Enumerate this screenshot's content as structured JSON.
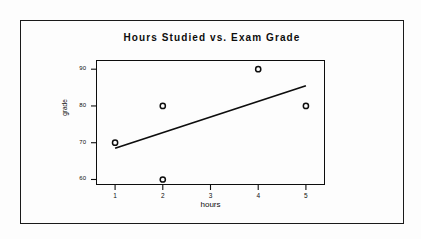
{
  "chart_data": {
    "type": "scatter",
    "title": "Hours Studied vs. Exam Grade",
    "xlabel": "hours",
    "ylabel": "grade",
    "x": [
      1,
      2,
      2,
      4,
      5
    ],
    "values": [
      70,
      80,
      60,
      90,
      80
    ],
    "points": [
      {
        "x": 1,
        "y": 70
      },
      {
        "x": 2,
        "y": 80
      },
      {
        "x": 2,
        "y": 60
      },
      {
        "x": 4,
        "y": 90
      },
      {
        "x": 5,
        "y": 80
      }
    ],
    "series": [
      {
        "name": "observations",
        "x": [
          1,
          2,
          2,
          4,
          5
        ],
        "values": [
          70,
          80,
          60,
          90,
          80
        ]
      },
      {
        "name": "trend line",
        "type": "line",
        "x": [
          1,
          5
        ],
        "values": [
          68.5,
          85.5
        ]
      }
    ],
    "xticks": [
      "1",
      "2",
      "3",
      "4",
      "5"
    ],
    "xtick_values": [
      1,
      2,
      3,
      4,
      5
    ],
    "yticks": [
      "60",
      "70",
      "80",
      "90"
    ],
    "ytick_values": [
      60,
      70,
      80,
      90
    ],
    "xlim": [
      0.6,
      5.4
    ],
    "ylim": [
      58.5,
      92.5
    ],
    "grid": false,
    "legend": false,
    "marker": "open-circle",
    "marker_color": "#0d0d0d",
    "line_color": "#0d0d0d",
    "background_color": "#fdfdfd",
    "frame_color": "#0d0d0d",
    "trendline": {
      "x_start": 1,
      "y_start": 68.5,
      "x_end": 5,
      "y_end": 85.5
    }
  }
}
